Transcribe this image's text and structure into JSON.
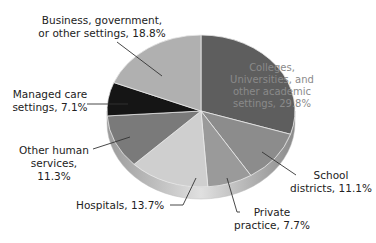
{
  "chart_data": {
    "type": "pie",
    "title": "",
    "style": "3d-tilted",
    "slices": [
      {
        "label": "Colleges, Universities, and other academic settings",
        "value": 29.8,
        "display": "Colleges, Universities, and other academic settings, 29.8%",
        "color": "#5e5e5e"
      },
      {
        "label": "School districts",
        "value": 11.1,
        "display": "School districts, 11.1%",
        "color": "#8c8c8c"
      },
      {
        "label": "Private practice",
        "value": 7.7,
        "display": "Private practice, 7.7%",
        "color": "#9a9a9a"
      },
      {
        "label": "Hospitals",
        "value": 13.7,
        "display": "Hospitals, 13.7%",
        "color": "#cfcfcf"
      },
      {
        "label": "Other human services",
        "value": 11.3,
        "display": "Other human services, 11.3%",
        "color": "#7a7a7a"
      },
      {
        "label": "Managed care settings",
        "value": 7.1,
        "display": "Managed care settings, 7.1%",
        "color": "#151515"
      },
      {
        "label": "Business, government, or other settings",
        "value": 18.8,
        "display": "Business, government, or other settings, 18.8%",
        "color": "#b0b0b0"
      }
    ],
    "legend": "none (callout labels)"
  },
  "labels": {
    "academic": [
      "Colleges,",
      "Universities, and",
      "other academic",
      "settings, 29.8%"
    ],
    "school": [
      "School",
      "districts, 11.1%"
    ],
    "private": [
      "Private",
      "practice, 7.7%"
    ],
    "hospitals": [
      "Hospitals, 13.7%"
    ],
    "other": [
      "Other human",
      "services, 11.3%"
    ],
    "managed": [
      "Managed care",
      "settings, 7.1%"
    ],
    "business": [
      "Business, government,",
      "or other settings, 18.8%"
    ]
  }
}
